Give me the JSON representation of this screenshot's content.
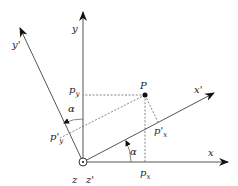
{
  "diagram": {
    "point": {
      "label": "P"
    },
    "axes": {
      "x": {
        "label": "x"
      },
      "y": {
        "label": "y"
      },
      "x_prime": {
        "label": "x'"
      },
      "y_prime": {
        "label": "y'"
      },
      "z": {
        "label": "z"
      },
      "z_prime": {
        "label": "z'"
      }
    },
    "projections": {
      "px": {
        "base": "p",
        "sub": "x"
      },
      "py": {
        "base": "p",
        "sub": "y"
      },
      "px_prime": {
        "base": "p'",
        "sub": "x"
      },
      "py_prime": {
        "base": "p'",
        "sub": "y"
      }
    },
    "angles": {
      "alpha_x": {
        "label": "α"
      },
      "alpha_y": {
        "label": "α"
      }
    },
    "rotation_angle_deg": 25
  }
}
